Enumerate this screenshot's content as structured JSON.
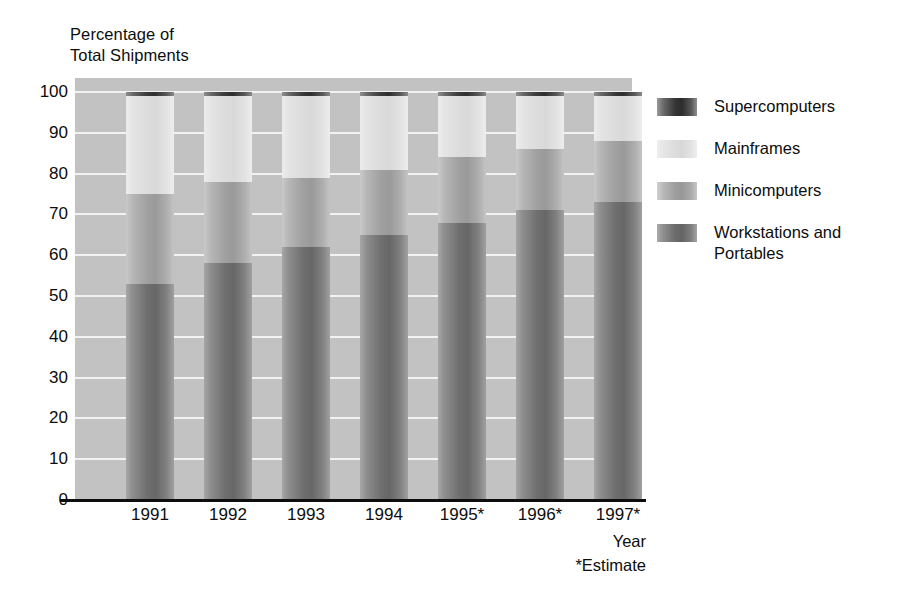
{
  "chart_data": {
    "type": "bar",
    "subtype": "stacked-bar-100-percent",
    "title": "",
    "ylabel": "Percentage of\nTotal Shipments",
    "xlabel": "Year",
    "footnote": "*Estimate",
    "ylim": [
      0,
      100
    ],
    "y_ticks": [
      "100",
      "90",
      "80",
      "70",
      "60",
      "50",
      "40",
      "30",
      "20",
      "10",
      "0"
    ],
    "grid": true,
    "legend_position": "right",
    "categories": [
      "1991",
      "1992",
      "1993",
      "1994",
      "1995*",
      "1996*",
      "1997*"
    ],
    "series": [
      {
        "name": "Workstations and\nPortables",
        "key": "work",
        "values": [
          53,
          58,
          62,
          65,
          68,
          71,
          73
        ]
      },
      {
        "name": "Minicomputers",
        "key": "mini",
        "values": [
          22,
          20,
          17,
          16,
          16,
          15,
          15
        ]
      },
      {
        "name": "Mainframes",
        "key": "main",
        "values": [
          24,
          21,
          20,
          18,
          15,
          13,
          11
        ]
      },
      {
        "name": "Supercomputers",
        "key": "super",
        "values": [
          1,
          1,
          1,
          1,
          1,
          1,
          1
        ]
      }
    ],
    "stack_order_bottom_to_top": [
      "work",
      "mini",
      "main",
      "super"
    ],
    "bars": [
      {
        "label": "1991",
        "work": 53,
        "mini": 22,
        "main": 24,
        "super": 1
      },
      {
        "label": "1992",
        "work": 58,
        "mini": 20,
        "main": 21,
        "super": 1
      },
      {
        "label": "1993",
        "work": 62,
        "mini": 17,
        "main": 20,
        "super": 1
      },
      {
        "label": "1994",
        "work": 65,
        "mini": 16,
        "main": 18,
        "super": 1
      },
      {
        "label": "1995*",
        "work": 68,
        "mini": 16,
        "main": 15,
        "super": 1
      },
      {
        "label": "1996*",
        "work": 71,
        "mini": 15,
        "main": 13,
        "super": 1
      },
      {
        "label": "1997*",
        "work": 73,
        "mini": 15,
        "main": 11,
        "super": 1
      }
    ]
  },
  "legend": {
    "items": [
      {
        "label": "Supercomputers",
        "key": "super",
        "color": "#2f2f2f"
      },
      {
        "label": "Mainframes",
        "key": "main",
        "color": "#dcdcdc"
      },
      {
        "label": "Minicomputers",
        "key": "mini",
        "color": "#9e9e9e"
      },
      {
        "label": "Workstations and\nPortables",
        "key": "work",
        "color": "#6c6c6c"
      }
    ]
  },
  "axes": {
    "y_title": "Percentage of\nTotal Shipments",
    "x_title": "Year",
    "estimate_note": "*Estimate",
    "y_ticks": [
      "100",
      "90",
      "80",
      "70",
      "60",
      "50",
      "40",
      "30",
      "20",
      "10",
      "0"
    ],
    "x_ticks": [
      "1991",
      "1992",
      "1993",
      "1994",
      "1995*",
      "1996*",
      "1997*"
    ]
  },
  "colors": {
    "plot_background": "#c2c2c2",
    "gridline": "#f2f2f2",
    "axis": "#0d0d0d",
    "page_background": "#ffffff",
    "text": "#0d0d0d"
  }
}
